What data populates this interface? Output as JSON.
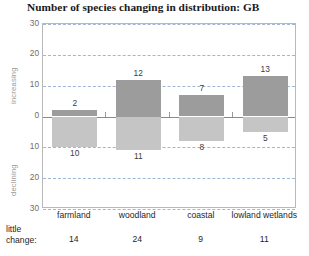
{
  "chart_data": {
    "type": "bar",
    "title": "Number of species changing in distribution: GB",
    "xlabel": "",
    "ylabel": "",
    "ylim": [
      -30,
      30
    ],
    "ytick_labels": [
      "30",
      "20",
      "10",
      "0",
      "10",
      "20",
      "30"
    ],
    "ytick_values": [
      30,
      20,
      10,
      0,
      -10,
      -20,
      -30
    ],
    "grid": true,
    "legend": "none",
    "axis_captions": {
      "positive": "increasing",
      "negative": "declining"
    },
    "categories": [
      "farmland",
      "woodland",
      "coastal",
      "lowland wetlands"
    ],
    "series": [
      {
        "name": "increasing",
        "color": "#9c9c9c",
        "values": [
          2,
          12,
          7,
          13
        ]
      },
      {
        "name": "declining",
        "color": "#c5c5c5",
        "values": [
          10,
          11,
          8,
          5
        ]
      }
    ],
    "annotations": {
      "little_change_label": "little\nchange:",
      "little_change_values": [
        14,
        24,
        9,
        11
      ]
    }
  },
  "footer": {
    "label_line1": "little",
    "label_line2": "change:"
  },
  "colors": {
    "increasing_bar": "#9c9c9c",
    "declining_bar": "#c5c5c5",
    "gridline": "#9fb7d4",
    "zeroline": "#8a8a8a",
    "frame": "#b9b9b9"
  }
}
